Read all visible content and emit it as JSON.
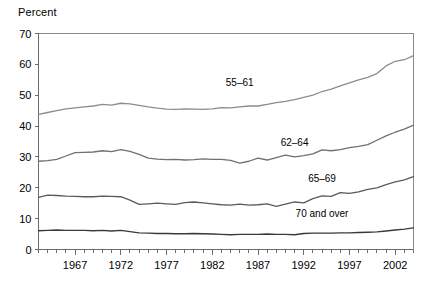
{
  "chart_data": {
    "type": "line",
    "title": "",
    "subtitle": "",
    "ylabel": "Percent",
    "xlabel": "",
    "ylim": [
      0,
      70
    ],
    "yticks": [
      0,
      10,
      20,
      30,
      40,
      50,
      60,
      70
    ],
    "ytick_labels": [
      "0",
      "10",
      "20",
      "30",
      "40",
      "50",
      "60",
      "70"
    ],
    "xlim": [
      1963,
      2004
    ],
    "xticks": [
      1967,
      1972,
      1977,
      1982,
      1987,
      1992,
      1997,
      2002
    ],
    "xtick_labels": [
      "1967",
      "1972",
      "1977",
      "1982",
      "1987",
      "1992",
      "1997",
      "2002"
    ],
    "minor_xticks_every": 1,
    "grid": false,
    "legend_position": "inline-annotations",
    "x": [
      1963,
      1964,
      1965,
      1966,
      1967,
      1968,
      1969,
      1970,
      1971,
      1972,
      1973,
      1974,
      1975,
      1976,
      1977,
      1978,
      1979,
      1980,
      1981,
      1982,
      1983,
      1984,
      1985,
      1986,
      1987,
      1988,
      1989,
      1990,
      1991,
      1992,
      1993,
      1994,
      1995,
      1996,
      1997,
      1998,
      1999,
      2000,
      2001,
      2002,
      2003,
      2004
    ],
    "series": [
      {
        "name": "55–61",
        "color": "#8c8c8c",
        "label_x": 1985,
        "label_y": 53,
        "values": [
          43.8,
          44.4,
          45.0,
          45.6,
          45.9,
          46.2,
          46.5,
          47.0,
          46.8,
          47.4,
          47.2,
          46.7,
          46.2,
          45.8,
          45.5,
          45.4,
          45.6,
          45.5,
          45.4,
          45.6,
          46.0,
          45.9,
          46.2,
          46.5,
          46.5,
          47.0,
          47.6,
          48.0,
          48.6,
          49.3,
          50.0,
          51.2,
          52.0,
          53.0,
          54.0,
          55.0,
          55.8,
          57.0,
          59.5,
          61.0,
          61.5,
          62.8
        ]
      },
      {
        "name": "62–64",
        "color": "#707070",
        "label_x": 1991,
        "label_y": 33.5,
        "values": [
          28.6,
          28.8,
          29.2,
          30.3,
          31.4,
          31.5,
          31.6,
          32.0,
          31.7,
          32.4,
          31.8,
          30.8,
          29.6,
          29.3,
          29.1,
          29.2,
          29.0,
          29.1,
          29.4,
          29.2,
          29.2,
          28.9,
          28.0,
          28.6,
          29.6,
          29.0,
          29.8,
          30.6,
          30.0,
          30.4,
          31.0,
          32.3,
          32.0,
          32.4,
          33.0,
          33.4,
          34.0,
          35.4,
          36.8,
          38.0,
          39.0,
          40.3
        ]
      },
      {
        "name": "65–69",
        "color": "#5a5a5a",
        "label_x": 1994,
        "label_y": 21.8,
        "values": [
          16.9,
          17.6,
          17.5,
          17.3,
          17.2,
          17.1,
          17.1,
          17.3,
          17.2,
          17.1,
          16.0,
          14.6,
          14.8,
          15.0,
          14.8,
          14.6,
          15.2,
          15.4,
          15.1,
          14.8,
          14.5,
          14.4,
          14.7,
          14.4,
          14.5,
          14.8,
          14.0,
          14.7,
          15.4,
          15.1,
          16.5,
          17.4,
          17.2,
          18.4,
          18.2,
          18.7,
          19.5,
          20.0,
          21.0,
          21.9,
          22.6,
          23.6
        ]
      },
      {
        "name": "70 and over",
        "color": "#3a3a3a",
        "label_x": 1994,
        "label_y": 10.5,
        "values": [
          6.1,
          6.2,
          6.3,
          6.2,
          6.2,
          6.2,
          6.1,
          6.2,
          6.0,
          6.2,
          5.8,
          5.4,
          5.3,
          5.2,
          5.2,
          5.1,
          5.1,
          5.2,
          5.1,
          5.0,
          4.9,
          4.8,
          4.9,
          4.9,
          4.9,
          5.0,
          4.9,
          4.9,
          4.8,
          5.2,
          5.3,
          5.3,
          5.3,
          5.4,
          5.4,
          5.5,
          5.6,
          5.7,
          6.0,
          6.3,
          6.6,
          7.0
        ]
      }
    ]
  }
}
